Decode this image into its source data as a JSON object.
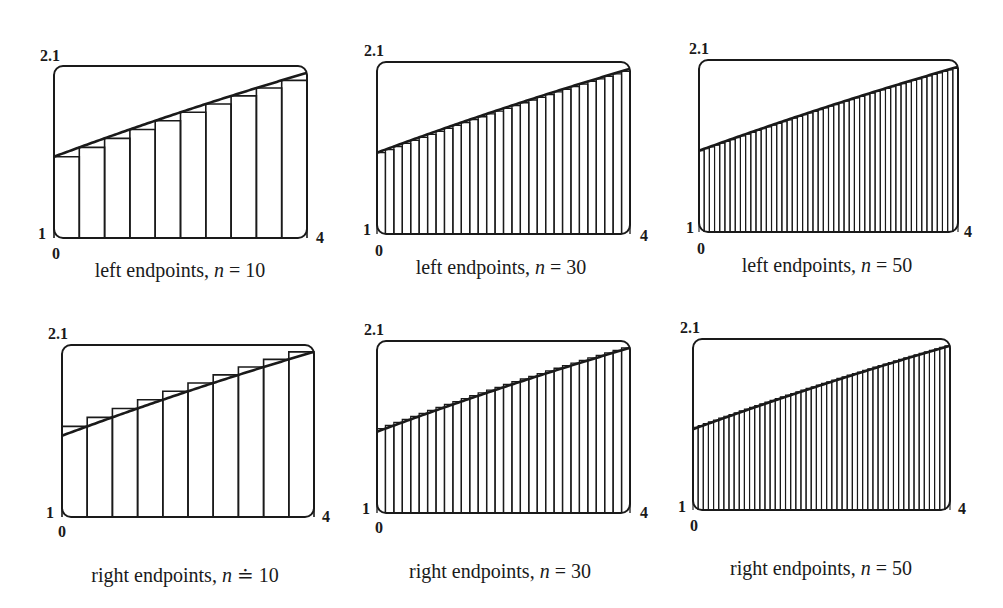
{
  "chart_data": [
    {
      "type": "area",
      "title": "left endpoints, n = 10",
      "caption_prefix": "left endpoints, ",
      "caption_var": "n",
      "caption_eq": " = 10",
      "method": "left",
      "n": 10,
      "xlim": [
        0,
        4
      ],
      "ylim": [
        1,
        2.1
      ],
      "tick_labels": {
        "ymax": "2.1",
        "ymin": "1",
        "xmin": "0",
        "xmax": "4"
      },
      "box": {
        "x": 54,
        "y": 66,
        "w": 253,
        "h": 172
      },
      "labels_pos": {
        "ymax": [
          40,
          48
        ],
        "ymin": [
          38,
          226
        ],
        "xmin": [
          52,
          246
        ],
        "xmax": [
          316,
          230
        ],
        "caption": [
          180,
          260
        ]
      }
    },
    {
      "type": "area",
      "title": "left endpoints, n = 30",
      "caption_prefix": "left endpoints, ",
      "caption_var": "n",
      "caption_eq": " = 30",
      "method": "left",
      "n": 30,
      "xlim": [
        0,
        4
      ],
      "ylim": [
        1,
        2.1
      ],
      "tick_labels": {
        "ymax": "2.1",
        "ymin": "1",
        "xmin": "0",
        "xmax": "4"
      },
      "box": {
        "x": 377,
        "y": 62,
        "w": 253,
        "h": 172
      },
      "labels_pos": {
        "ymax": [
          364,
          43
        ],
        "ymin": [
          363,
          222
        ],
        "xmin": [
          375,
          243
        ],
        "xmax": [
          640,
          228
        ],
        "caption": [
          501,
          257
        ]
      }
    },
    {
      "type": "area",
      "title": "left endpoints, n = 50",
      "caption_prefix": "left endpoints, ",
      "caption_var": "n",
      "caption_eq": " = 50",
      "method": "left",
      "n": 50,
      "xlim": [
        0,
        4
      ],
      "ylim": [
        1,
        2.1
      ],
      "tick_labels": {
        "ymax": "2.1",
        "ymin": "1",
        "xmin": "0",
        "xmax": "4"
      },
      "box": {
        "x": 699,
        "y": 60,
        "w": 259,
        "h": 172
      },
      "labels_pos": {
        "ymax": [
          689,
          41
        ],
        "ymin": [
          686,
          220
        ],
        "xmin": [
          697,
          241
        ],
        "xmax": [
          964,
          224
        ],
        "caption": [
          827,
          255
        ]
      }
    },
    {
      "type": "area",
      "title": "right endpoints, n = 10",
      "caption_prefix": "right endpoints, ",
      "caption_var": "n",
      "caption_eq": " ≐ 10",
      "method": "right",
      "n": 10,
      "xlim": [
        0,
        4
      ],
      "ylim": [
        1,
        2.1
      ],
      "tick_labels": {
        "ymax": "2.1",
        "ymin": "1",
        "xmin": "0",
        "xmax": "4"
      },
      "box": {
        "x": 62,
        "y": 345,
        "w": 252,
        "h": 172
      },
      "labels_pos": {
        "ymax": [
          48,
          326
        ],
        "ymin": [
          46,
          505
        ],
        "xmin": [
          58,
          524
        ],
        "xmax": [
          322,
          509
        ],
        "caption": [
          185,
          565
        ]
      }
    },
    {
      "type": "area",
      "title": "right endpoints, n = 30",
      "caption_prefix": "right endpoints, ",
      "caption_var": "n",
      "caption_eq": " = 30",
      "method": "right",
      "n": 30,
      "xlim": [
        0,
        4
      ],
      "ylim": [
        1,
        2.1
      ],
      "tick_labels": {
        "ymax": "2.1",
        "ymin": "1",
        "xmin": "0",
        "xmax": "4"
      },
      "box": {
        "x": 377,
        "y": 341,
        "w": 253,
        "h": 172
      },
      "labels_pos": {
        "ymax": [
          364,
          322
        ],
        "ymin": [
          362,
          501
        ],
        "xmin": [
          375,
          520
        ],
        "xmax": [
          640,
          505
        ],
        "caption": [
          500,
          561
        ]
      }
    },
    {
      "type": "area",
      "title": "right endpoints, n = 50",
      "caption_prefix": "right endpoints, ",
      "caption_var": "n",
      "caption_eq": " = 50",
      "method": "right",
      "n": 50,
      "xlim": [
        0,
        4
      ],
      "ylim": [
        1,
        2.1
      ],
      "tick_labels": {
        "ymax": "2.1",
        "ymin": "1",
        "xmin": "0",
        "xmax": "4"
      },
      "box": {
        "x": 693,
        "y": 339,
        "w": 257,
        "h": 171
      },
      "labels_pos": {
        "ymax": [
          680,
          320
        ],
        "ymin": [
          678,
          499
        ],
        "xmin": [
          690,
          518
        ],
        "xmax": [
          958,
          501
        ],
        "caption": [
          821,
          558
        ]
      }
    }
  ],
  "curve": {
    "description": "increasing concave function on [0,4], f(0)≈1.52, f(2)≈1.80, f(4)≈2.06",
    "coefficients": [
      1.52,
      0.15,
      -0.004
    ],
    "samples": {
      "x": [
        0,
        1,
        2,
        3,
        4
      ],
      "y": [
        1.52,
        1.666,
        1.804,
        1.934,
        2.056
      ]
    }
  },
  "style": {
    "stroke": "#1a1a1a",
    "background": "#ffffff"
  }
}
